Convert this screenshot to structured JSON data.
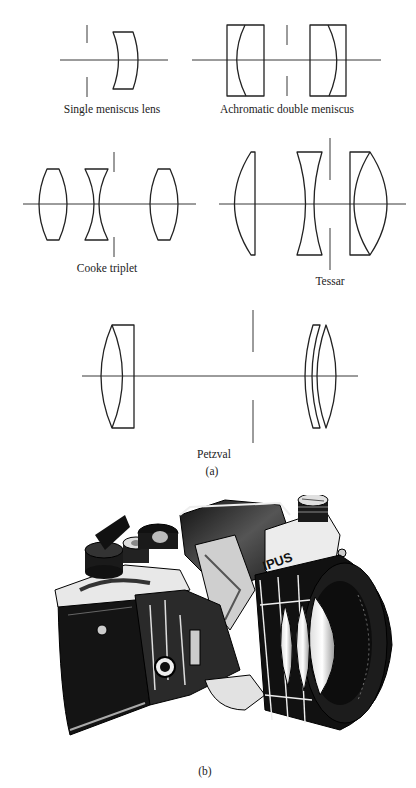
{
  "figure": {
    "panel_a": {
      "label": "(a)",
      "diagrams": [
        {
          "id": "single-meniscus",
          "caption": "Single meniscus lens"
        },
        {
          "id": "achromatic-double-meniscus",
          "caption": "Achromatic double meniscus"
        },
        {
          "id": "cooke-triplet",
          "caption": "Cooke triplet"
        },
        {
          "id": "tessar",
          "caption": "Tessar"
        },
        {
          "id": "petzval",
          "caption": "Petzval"
        }
      ]
    },
    "panel_b": {
      "label": "(b)",
      "description": "Cutaway illustration of a single-lens reflex camera",
      "brand_text": "IPUS"
    }
  }
}
